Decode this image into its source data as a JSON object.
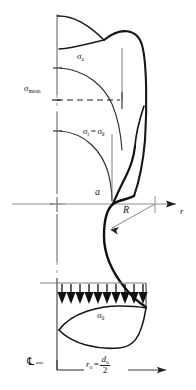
{
  "figure": {
    "ink_color": "#161616",
    "axis_color": "#8a8a8a",
    "background": "#ffffff"
  },
  "labels": {
    "sigma_z": {
      "symbol": "σ",
      "subscript": "z",
      "x": 78,
      "y": 52
    },
    "sigma_mean": {
      "symbol": "σ",
      "subscript": "mean",
      "x": 25,
      "y": 84
    },
    "sigma_r_theta": {
      "symbol": "σ",
      "subscript": "r",
      "equals": "=",
      "symbol2": "σ",
      "subscript2": "θ",
      "x": 84,
      "y": 127
    },
    "a": {
      "text": "a",
      "x": 96,
      "y": 190
    },
    "R": {
      "text": "R",
      "x": 124,
      "y": 207
    },
    "r_axis": {
      "text": "r",
      "x": 180,
      "y": 209
    },
    "sigma_0": {
      "symbol": "σ",
      "subscript": "0",
      "x": 98,
      "y": 311
    },
    "centerline": {
      "text": "℄",
      "x": 29,
      "y": 359
    },
    "r_o_formula": {
      "lhs": "r",
      "lhs_sub": "o",
      "eq": "=",
      "num": "d",
      "num_sub": "o",
      "den": "2",
      "x": 88,
      "y": 357
    }
  },
  "arrows": {
    "pressure_arrow_count": 10,
    "pressure_arrow_direction": "down",
    "r_axis_arrow_direction": "right",
    "bottom_arrow_direction": "right"
  },
  "axes": {
    "horizontal_axis_y": 204,
    "vertical_axis_x": 57,
    "center_marker": "+",
    "right_tick_x": 155
  }
}
